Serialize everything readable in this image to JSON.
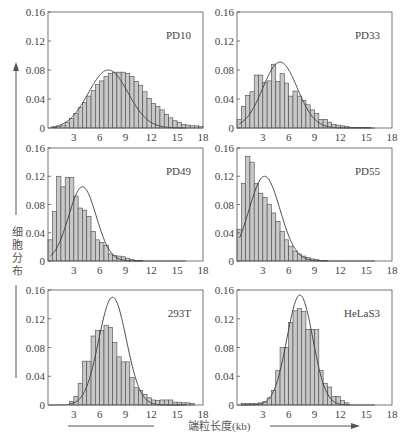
{
  "figure": {
    "ylabel": "细胞分布",
    "xlabel": "端粒长度(kb)",
    "colors": {
      "bar_fill": "#c8c8c8",
      "bar_stroke": "#4a4a4a",
      "curve": "#3a3a3a",
      "axis": "#555555",
      "text": "#444444"
    }
  },
  "chart_data": [
    {
      "type": "bar",
      "title": "PD10",
      "xlabel": "端粒长度(kb)",
      "ylabel": "细胞分布",
      "xlim": [
        0,
        18
      ],
      "ylim": [
        0,
        0.16
      ],
      "xticks": [
        3,
        6,
        9,
        12,
        15,
        18
      ],
      "yticks": [
        "0",
        "0.04",
        "0.08",
        "0.12",
        "0.16"
      ],
      "bin_width": 0.5,
      "bin_start": 0.5,
      "values": [
        0.001,
        0.002,
        0.004,
        0.008,
        0.013,
        0.02,
        0.028,
        0.035,
        0.044,
        0.052,
        0.06,
        0.065,
        0.071,
        0.075,
        0.077,
        0.077,
        0.077,
        0.075,
        0.071,
        0.064,
        0.059,
        0.05,
        0.041,
        0.034,
        0.03,
        0.025,
        0.019,
        0.014,
        0.01,
        0.008,
        0.005,
        0.004,
        0.003,
        0.003,
        0.002
      ],
      "fit_curve": {
        "mean": 7.0,
        "sd": 2.3,
        "peak": 0.08
      },
      "grid": false,
      "legend": false
    },
    {
      "type": "bar",
      "title": "PD33",
      "xlabel": "端粒长度(kb)",
      "ylabel": "细胞分布",
      "xlim": [
        0,
        18
      ],
      "ylim": [
        0,
        0.16
      ],
      "xticks": [
        3,
        6,
        9,
        12,
        15,
        18
      ],
      "yticks": [
        "0",
        "0.04",
        "0.08",
        "0.12",
        "0.16"
      ],
      "bin_width": 0.5,
      "bin_start": 0.0,
      "values": [
        0.012,
        0.03,
        0.045,
        0.05,
        0.073,
        0.073,
        0.063,
        0.065,
        0.088,
        0.064,
        0.075,
        0.062,
        0.044,
        0.051,
        0.044,
        0.038,
        0.032,
        0.025,
        0.02,
        0.012,
        0.012,
        0.008,
        0.005,
        0.004,
        0.003,
        0.002,
        0.001,
        0.001,
        0.001,
        0.001,
        0.001
      ],
      "fit_curve": {
        "mean": 5.0,
        "sd": 2.0,
        "peak": 0.091
      },
      "grid": false,
      "legend": false
    },
    {
      "type": "bar",
      "title": "PD49",
      "xlabel": "端粒长度(kb)",
      "ylabel": "细胞分布",
      "xlim": [
        0,
        18
      ],
      "ylim": [
        0,
        0.16
      ],
      "xticks": [
        3,
        6,
        9,
        12,
        15,
        18
      ],
      "yticks": [
        "0",
        "0.04",
        "0.08",
        "0.12",
        "0.16"
      ],
      "bin_width": 0.5,
      "bin_start": 0.0,
      "values": [
        0.03,
        0.07,
        0.12,
        0.105,
        0.118,
        0.118,
        0.092,
        0.075,
        0.072,
        0.063,
        0.042,
        0.03,
        0.026,
        0.022,
        0.01,
        0.008,
        0.007,
        0.006,
        0.004,
        0.002,
        0.001,
        0.001
      ],
      "fit_curve": {
        "mean": 4.0,
        "sd": 1.6,
        "peak": 0.105
      },
      "grid": false,
      "legend": false
    },
    {
      "type": "bar",
      "title": "PD55",
      "xlabel": "端粒长度(kb)",
      "ylabel": "细胞分布",
      "xlim": [
        0,
        18
      ],
      "ylim": [
        0,
        0.16
      ],
      "xticks": [
        3,
        6,
        9,
        12,
        15,
        18
      ],
      "yticks": [
        "0",
        "0.04",
        "0.08",
        "0.12",
        "0.16"
      ],
      "bin_width": 0.5,
      "bin_start": 0.0,
      "values": [
        0.045,
        0.11,
        0.148,
        0.14,
        0.11,
        0.096,
        0.09,
        0.08,
        0.068,
        0.056,
        0.042,
        0.03,
        0.021,
        0.014,
        0.01,
        0.007,
        0.005,
        0.003,
        0.002,
        0.001,
        0.001
      ],
      "fit_curve": {
        "mean": 3.2,
        "sd": 1.8,
        "peak": 0.12
      },
      "grid": false,
      "legend": false
    },
    {
      "type": "bar",
      "title": "293T",
      "xlabel": "端粒长度(kb)",
      "ylabel": "细胞分布",
      "xlim": [
        0,
        18
      ],
      "ylim": [
        0,
        0.16
      ],
      "xticks": [
        3,
        6,
        9,
        12,
        15,
        18
      ],
      "yticks": [
        "0",
        "0.04",
        "0.08",
        "0.12",
        "0.16"
      ],
      "bin_width": 0.5,
      "bin_start": 2.5,
      "values": [
        0.005,
        0.012,
        0.03,
        0.061,
        0.061,
        0.096,
        0.104,
        0.104,
        0.111,
        0.108,
        0.087,
        0.067,
        0.06,
        0.06,
        0.038,
        0.024,
        0.02,
        0.015,
        0.01,
        0.007,
        0.006,
        0.007,
        0.007,
        0.007,
        0.004,
        0.004,
        0.003,
        0.003,
        0.002
      ],
      "fit_curve": {
        "mean": 7.5,
        "sd": 1.6,
        "peak": 0.15
      },
      "grid": false,
      "legend": false
    },
    {
      "type": "bar",
      "title": "HeLaS3",
      "xlabel": "端粒长度(kb)",
      "ylabel": "细胞分布",
      "xlim": [
        0,
        18
      ],
      "ylim": [
        0,
        0.16
      ],
      "xticks": [
        3,
        6,
        9,
        12,
        15,
        18
      ],
      "yticks": [
        "0",
        "0.04",
        "0.08",
        "0.12",
        "0.16"
      ],
      "bin_width": 0.5,
      "bin_start": 0.5,
      "values": [
        0.002,
        0.002,
        0.002,
        0.002,
        0.003,
        0.005,
        0.01,
        0.02,
        0.048,
        0.08,
        0.08,
        0.115,
        0.131,
        0.134,
        0.13,
        0.105,
        0.105,
        0.105,
        0.048,
        0.03,
        0.025,
        0.012,
        0.012,
        0.006,
        0.003
      ],
      "fit_curve": {
        "mean": 7.3,
        "sd": 1.5,
        "peak": 0.153
      },
      "grid": false,
      "legend": false
    }
  ]
}
